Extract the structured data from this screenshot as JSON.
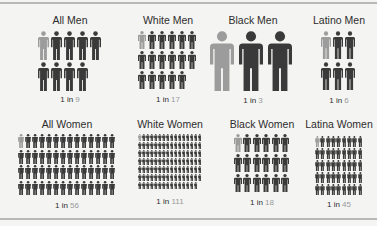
{
  "colors": {
    "highlight": "#9c9c9c",
    "base": "#3a3a3a",
    "background": "#f4f4f2"
  },
  "chart_data": {
    "type": "isotype",
    "title": "",
    "categories": [
      "All Men",
      "White Men",
      "Black Men",
      "Latino Men",
      "All Women",
      "White Women",
      "Black Women",
      "Latina Women"
    ],
    "values": [
      9,
      17,
      3,
      6,
      56,
      111,
      18,
      45
    ],
    "label_prefix": "1 in",
    "panels": [
      {
        "title": "All Men",
        "prefix": "1 in",
        "n": 9,
        "cols": 5,
        "size": "large"
      },
      {
        "title": "White Men",
        "prefix": "1 in",
        "n": 17,
        "cols": 6,
        "size": "medium"
      },
      {
        "title": "Black Men",
        "prefix": "1 in",
        "n": 3,
        "cols": 3,
        "size": "xlarge"
      },
      {
        "title": "Latino Men",
        "prefix": "1 in",
        "n": 6,
        "cols": 3,
        "size": "large"
      },
      {
        "title": "All Women",
        "prefix": "1 in",
        "n": 56,
        "cols": 14,
        "size": "small"
      },
      {
        "title": "White Women",
        "prefix": "1 in",
        "n": 111,
        "cols": 16,
        "size": "tiny"
      },
      {
        "title": "Black Women",
        "prefix": "1 in",
        "n": 18,
        "cols": 6,
        "size": "medium"
      },
      {
        "title": "Latina Women",
        "prefix": "1 in",
        "n": 45,
        "cols": 9,
        "size": "small"
      }
    ]
  }
}
